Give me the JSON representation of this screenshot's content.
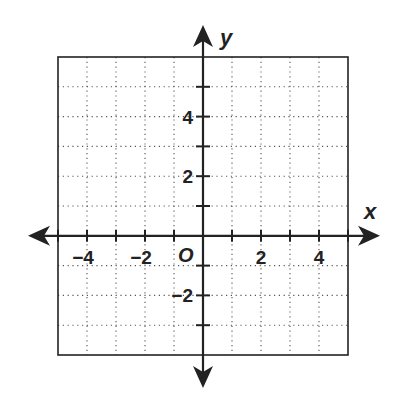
{
  "chart_data": {
    "type": "scatter",
    "title": "",
    "xlabel": "x",
    "ylabel": "y",
    "origin_label": "O",
    "xlim": [
      -5,
      5
    ],
    "ylim": [
      -4,
      6
    ],
    "grid": true,
    "grid_style": "dotted",
    "grid_step": 1,
    "x_ticks": [
      -5,
      -4,
      -3,
      -2,
      -1,
      1,
      2,
      3,
      4,
      5
    ],
    "y_ticks": [
      -3,
      -2,
      -1,
      1,
      2,
      3,
      4,
      5
    ],
    "x_tick_labels": [
      {
        "value": -4,
        "text": "−4"
      },
      {
        "value": -2,
        "text": "−2"
      },
      {
        "value": 2,
        "text": "2"
      },
      {
        "value": 4,
        "text": "4"
      }
    ],
    "y_tick_labels": [
      {
        "value": 4,
        "text": "4"
      },
      {
        "value": 2,
        "text": "2"
      },
      {
        "value": -2,
        "text": "−2"
      }
    ],
    "series": [],
    "colors": {
      "ink": "#222222",
      "grid": "#555555",
      "background": "#ffffff"
    }
  }
}
